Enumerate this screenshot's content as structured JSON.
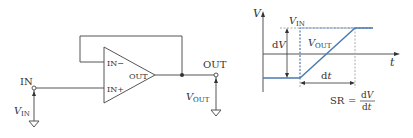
{
  "circuit": {
    "opamp": {
      "in_minus_label": "IN−",
      "in_plus_label": "IN+",
      "out_label": "OUT"
    },
    "input_terminal_label": "IN",
    "output_terminal_label": "OUT",
    "vin_label_main": "V",
    "vin_label_sub": "IN",
    "vout_label_main": "V",
    "vout_label_sub": "OUT"
  },
  "graph": {
    "y_axis_label": "V",
    "x_axis_label": "t",
    "vin_label_main": "V",
    "vin_label_sub": "IN",
    "vout_label_main": "V",
    "vout_label_sub": "OUT",
    "dv_label_d": "d",
    "dv_label_v": "V",
    "dt_label_d": "d",
    "dt_label_t": "t",
    "slew_rate": {
      "lhs": "SR",
      "equals": "=",
      "num_d": "d",
      "num_v": "V",
      "den_d": "d",
      "den_t": "t"
    }
  },
  "colors": {
    "line": "#555555",
    "signal": "#4a7ab0",
    "guide": "#aaaaaa"
  }
}
